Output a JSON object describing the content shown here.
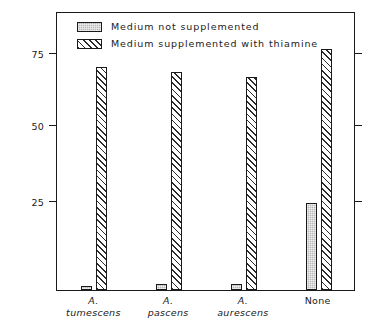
{
  "chart_data": {
    "type": "bar",
    "title": "",
    "xlabel": "",
    "ylabel": "Weight of fungus mat, mg",
    "categories": [
      "A. tumescens",
      "A. pascens",
      "A. aurescens",
      "None"
    ],
    "category_lines": [
      {
        "line1": "A.",
        "line2": "tumescens",
        "italic": true
      },
      {
        "line1": "A.",
        "line2": "pascens",
        "italic": true
      },
      {
        "line1": "A.",
        "line2": "aurescens",
        "italic": true
      },
      {
        "line1": "None",
        "line2": "",
        "italic": false
      }
    ],
    "series": [
      {
        "name": "Medium not supplemented",
        "values": [
          1.5,
          2,
          2,
          29.5
        ],
        "fill": "solid-gray"
      },
      {
        "name": "Medium supplemented with thiamine",
        "values": [
          75.5,
          73.5,
          72,
          81.5
        ],
        "fill": "diagonal-hatch"
      }
    ],
    "yticks": [
      25,
      50,
      75
    ],
    "ytick_labels": [
      "25",
      "50",
      "75"
    ],
    "ylim": [
      0,
      94
    ],
    "grid": false,
    "legend_position": "top-left",
    "colors": {
      "solid_fill": "#b8b8b8",
      "hatch_stroke": "#2b2b2b",
      "axis": "#1a1a1a",
      "background": "#ffffff"
    }
  },
  "legend": {
    "items": [
      {
        "label": "Medium not supplemented",
        "swatch": "solid-gray-swatch"
      },
      {
        "label": "Medium supplemented with thiamine",
        "swatch": "hatched-swatch"
      }
    ]
  },
  "axis": {
    "y_title": "Weight of fungus mat, mg",
    "y_tick_0": "25",
    "y_tick_1": "50",
    "y_tick_2": "75"
  },
  "footer": {
    "caption": ""
  }
}
